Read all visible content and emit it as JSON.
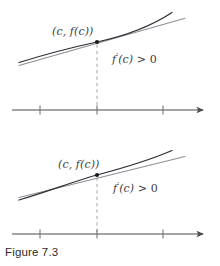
{
  "figure": {
    "caption": "Figure 7.3",
    "background_color": "#ffffff",
    "ink_color": "#3b3b42",
    "axis_color": "#4a4a50",
    "dash_color": "#9a9aa0",
    "curve_color": "#2e2e34",
    "tangent_color": "#8a8a90",
    "point_color": "#1b1b1f"
  },
  "panels": [
    {
      "id": "upper-panel",
      "name": "steep-tangent-panel",
      "point_label": "(c, f(c))",
      "derivative_label_parts": {
        "func": "f",
        "prime": "′",
        "arg": "(c)",
        "relation": " > 0"
      },
      "derivative_label": "f′(c) > 0",
      "point": {
        "x": 97,
        "y": 42
      },
      "axis": {
        "y": 110,
        "x_start": 12,
        "x_end": 206,
        "ticks": [
          40,
          97,
          163
        ]
      },
      "curve_description": "concave-up increasing curve",
      "tangent_description": "tangent line at c with positive slope"
    },
    {
      "id": "lower-panel",
      "name": "shallow-tangent-panel",
      "point_label": "(c, f(c))",
      "derivative_label_parts": {
        "func": "f",
        "prime": "′",
        "arg": "(c)",
        "relation": " > 0"
      },
      "derivative_label": "f′(c) > 0",
      "point": {
        "x": 97,
        "y": 175
      },
      "axis": {
        "y": 234,
        "x_start": 12,
        "x_end": 206,
        "ticks": [
          40,
          97,
          163
        ]
      },
      "curve_description": "gently concave-up increasing curve",
      "tangent_description": "tangent line at c with small positive slope"
    }
  ]
}
